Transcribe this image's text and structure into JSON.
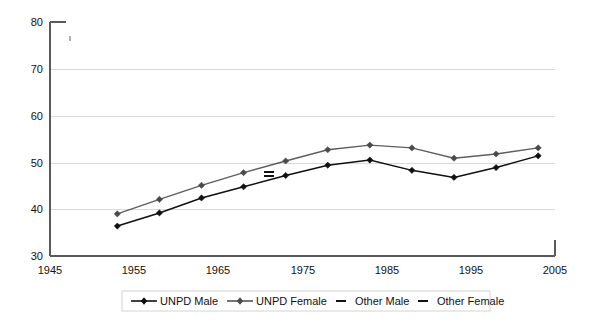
{
  "chart_data": {
    "type": "line",
    "title": "",
    "subtitle": "",
    "xlabel": "",
    "ylabel": "",
    "xlim": [
      1945,
      2005
    ],
    "ylim": [
      30,
      80
    ],
    "xticks": [
      1945,
      1955,
      1965,
      1975,
      1985,
      1995,
      2005
    ],
    "yticks": [
      30,
      40,
      50,
      60,
      70,
      80
    ],
    "grid": "horizontal",
    "legend_position": "bottom",
    "x": [
      1953,
      1958,
      1963,
      1968,
      1973,
      1978,
      1983,
      1988,
      1993,
      1998,
      2003
    ],
    "series": [
      {
        "name": "UNPD Male",
        "marker": "diamond",
        "color": "#101010",
        "values": [
          36.4,
          39.2,
          42.4,
          44.8,
          47.2,
          49.4,
          50.5,
          48.3,
          46.8,
          48.9,
          51.4
        ]
      },
      {
        "name": "UNPD Female",
        "marker": "diamond",
        "color": "#5e5e5e",
        "values": [
          39.0,
          42.1,
          45.1,
          47.8,
          50.3,
          52.7,
          53.7,
          53.1,
          50.9,
          51.8,
          53.1
        ]
      },
      {
        "name": "Other Male",
        "marker": "dash",
        "color": "#111111",
        "x": [
          1971
        ],
        "values": [
          47.0
        ]
      },
      {
        "name": "Other Female",
        "marker": "dash",
        "color": "#111111",
        "x": [
          1971
        ],
        "values": [
          48.0
        ]
      }
    ]
  },
  "axes": {
    "y_tick_labels": [
      "80",
      "70",
      "60",
      "50",
      "40",
      "30"
    ],
    "x_tick_labels": [
      "1945",
      "1955",
      "1965",
      "1975",
      "1985",
      "1995",
      "2005"
    ]
  },
  "legend": {
    "items": [
      {
        "label": "UNPD Male",
        "style": "line-diamond",
        "color": "#101010"
      },
      {
        "label": "UNPD Female",
        "style": "line-diamond",
        "color": "#4a4a4a"
      },
      {
        "label": "Other Male",
        "style": "dash",
        "color": "#111111"
      },
      {
        "label": "Other Female",
        "style": "dash",
        "color": "#111111"
      }
    ]
  }
}
